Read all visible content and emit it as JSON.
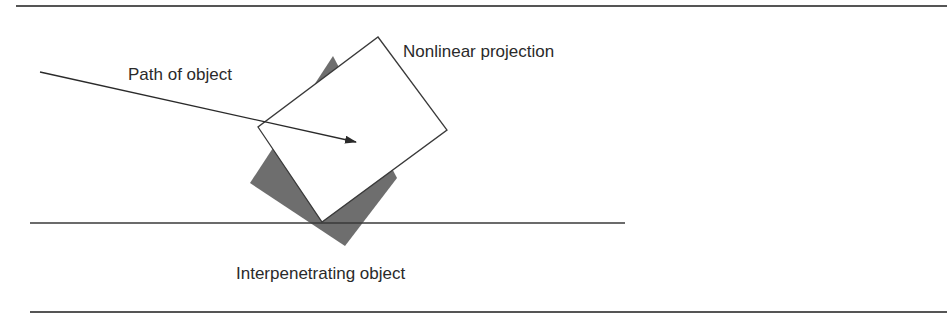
{
  "diagram": {
    "labels": {
      "path": "Path of object",
      "projection": "Nonlinear projection",
      "interpenetrating": "Interpenetrating object"
    },
    "colors": {
      "line": "#3a3a3a",
      "gray_fill": "#6e6e6e",
      "white_fill": "#ffffff",
      "text": "#2a2a2a"
    }
  }
}
